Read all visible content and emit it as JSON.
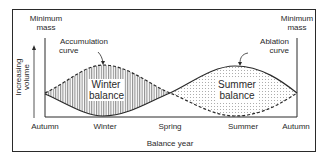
{
  "diagram": {
    "labels": {
      "min_mass_left_line1": "Minimum",
      "min_mass_left_line2": "mass",
      "min_mass_right_line1": "Minimum",
      "min_mass_right_line2": "mass",
      "accumulation_line1": "Accumulation",
      "accumulation_line2": "curve",
      "ablation_line1": "Ablation",
      "ablation_line2": "curve",
      "winter_balance_line1": "Winter",
      "winter_balance_line2": "balance",
      "summer_balance_line1": "Summer",
      "summer_balance_line2": "balance",
      "y_axis_line1": "Increasing",
      "y_axis_line2": "volume",
      "x_axis_title": "Balance year"
    },
    "x_ticks": [
      "Autumn",
      "Winter",
      "Spring",
      "Summer",
      "Autumn"
    ],
    "curves": [
      {
        "name": "Accumulation curve",
        "style": "dashed",
        "shape": "peaks in winter, minimum in summer"
      },
      {
        "name": "Ablation curve",
        "style": "solid",
        "shape": "minimum in winter, peaks in summer"
      }
    ],
    "regions": [
      {
        "name": "Winter balance",
        "fill": "vertical hatching"
      },
      {
        "name": "Summer balance",
        "fill": "dotted stipple"
      }
    ],
    "colors": {
      "ink": "#2a2a2a",
      "background": "#ffffff"
    }
  }
}
